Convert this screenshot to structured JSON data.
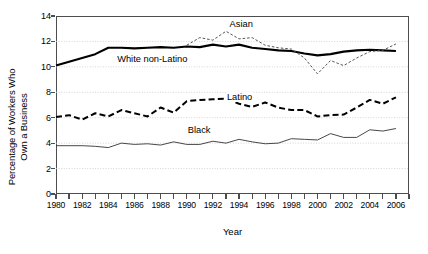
{
  "chart_data": {
    "type": "line",
    "title": "",
    "xlabel": "Year",
    "ylabel_line1": "Percentage of Workers Who",
    "ylabel_line2": "Own a Business",
    "ylabel": "Percentage of Workers Who Own a Business",
    "xlim": [
      1980,
      2007
    ],
    "ylim": [
      0,
      14
    ],
    "ytick_values": [
      0,
      2,
      4,
      6,
      8,
      10,
      12,
      14
    ],
    "ytick_labels": [
      "0",
      "2",
      "4",
      "6",
      "8",
      "10",
      "12",
      "14"
    ],
    "xtick_values": [
      1980,
      1981,
      1982,
      1983,
      1984,
      1985,
      1986,
      1987,
      1988,
      1989,
      1990,
      1991,
      1992,
      1993,
      1994,
      1995,
      1996,
      1997,
      1998,
      1999,
      2000,
      2001,
      2002,
      2003,
      2004,
      2005,
      2006,
      2007
    ],
    "xtick_labels_shown": [
      "1980",
      "1982",
      "1984",
      "1986",
      "1988",
      "1990",
      "1992",
      "1994",
      "1996",
      "1998",
      "2000",
      "2002",
      "2004",
      "2006"
    ],
    "grid": true,
    "grid_axis": "y",
    "legend_position": "inline-annotations",
    "x": [
      1980,
      1981,
      1982,
      1983,
      1984,
      1985,
      1986,
      1987,
      1988,
      1989,
      1990,
      1991,
      1992,
      1993,
      1994,
      1995,
      1996,
      1997,
      1998,
      1999,
      2000,
      2001,
      2002,
      2003,
      2004,
      2005,
      2006
    ],
    "series": [
      {
        "name": "White non-Latino",
        "style": "solid-thick",
        "color": "#000000",
        "label_x": 1984.6,
        "label_y": 10.55,
        "values": [
          10.1,
          10.4,
          10.7,
          11.0,
          11.5,
          11.5,
          11.45,
          11.5,
          11.55,
          11.5,
          11.6,
          11.55,
          11.75,
          11.6,
          11.75,
          11.5,
          11.4,
          11.3,
          11.25,
          11.05,
          10.9,
          11.0,
          11.2,
          11.3,
          11.35,
          11.3,
          11.25
        ]
      },
      {
        "name": "Asian",
        "style": "dotted",
        "color": "#555555",
        "label_x": 1993.2,
        "label_y": 13.3,
        "values": [
          null,
          null,
          null,
          null,
          null,
          null,
          null,
          null,
          null,
          null,
          11.7,
          12.3,
          12.1,
          12.8,
          12.2,
          12.3,
          11.7,
          11.5,
          11.4,
          10.7,
          9.45,
          10.5,
          10.1,
          10.7,
          11.2,
          11.3,
          11.8
        ]
      },
      {
        "name": "Latino",
        "style": "dashed",
        "color": "#000000",
        "label_x": 1993.0,
        "label_y": 7.55,
        "values": [
          6.05,
          6.2,
          5.85,
          6.35,
          6.1,
          6.6,
          6.35,
          6.1,
          6.8,
          6.4,
          7.3,
          7.4,
          7.45,
          7.5,
          7.1,
          6.85,
          7.2,
          6.8,
          6.6,
          6.6,
          6.1,
          6.2,
          6.25,
          6.8,
          7.4,
          7.1,
          7.6
        ]
      },
      {
        "name": "Black",
        "style": "solid-thin",
        "color": "#333333",
        "label_x": 1990.0,
        "label_y": 4.95,
        "values": [
          3.8,
          3.8,
          3.8,
          3.75,
          3.65,
          4.0,
          3.9,
          3.95,
          3.85,
          4.1,
          3.9,
          3.9,
          4.15,
          4.0,
          4.3,
          4.1,
          3.95,
          4.0,
          4.35,
          4.3,
          4.25,
          4.75,
          4.45,
          4.45,
          5.05,
          4.95,
          5.15
        ]
      }
    ]
  }
}
